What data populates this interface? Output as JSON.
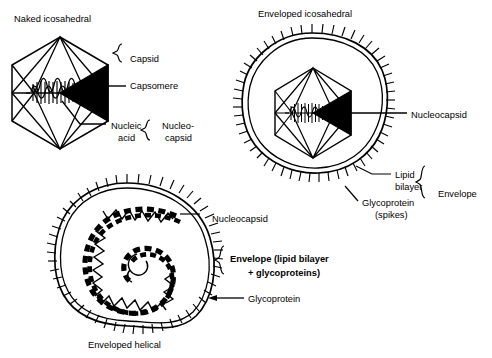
{
  "figure": {
    "background_color": "#ffffff",
    "ink_color": "#000000"
  },
  "panels": [
    {
      "id": "naked-icosahedral",
      "title": "Naked icosahedral",
      "title_pos": {
        "x": 14,
        "y": 22
      },
      "labels": [
        {
          "id": "capsid",
          "text": "Capsid",
          "x": 130,
          "y": 62
        },
        {
          "id": "capsomere",
          "text": "Capsomere",
          "x": 130,
          "y": 89
        },
        {
          "id": "nucleic-acid-1",
          "text": "Nucleic",
          "x": 111,
          "y": 129
        },
        {
          "id": "nucleic-acid-2",
          "text": "acid",
          "x": 118,
          "y": 141
        },
        {
          "id": "nucleocapsid-1",
          "text": "Nucleo-",
          "x": 162,
          "y": 129
        },
        {
          "id": "nucleocapsid-2",
          "text": "capsid",
          "x": 165,
          "y": 141
        }
      ],
      "braces": [
        "capsid-brace",
        "nucleocapsid-brace"
      ]
    },
    {
      "id": "enveloped-icosahedral",
      "title": "Enveloped icosahedral",
      "title_pos": {
        "x": 258,
        "y": 17
      },
      "labels": [
        {
          "id": "nucleocapsid",
          "text": "Nucleocapsid",
          "x": 411,
          "y": 118
        },
        {
          "id": "lipid-bilayer-1",
          "text": "Lipid",
          "x": 395,
          "y": 178
        },
        {
          "id": "lipid-bilayer-2",
          "text": "bilayer",
          "x": 395,
          "y": 190
        },
        {
          "id": "glycoprotein-1",
          "text": "Glycoprotein",
          "x": 362,
          "y": 206
        },
        {
          "id": "glycoprotein-2",
          "text": "(spikes)",
          "x": 375,
          "y": 218
        },
        {
          "id": "envelope",
          "text": "Envelope",
          "x": 438,
          "y": 197
        }
      ],
      "braces": [
        "envelope-brace"
      ]
    },
    {
      "id": "enveloped-helical",
      "title": "Enveloped helical",
      "title_pos": {
        "x": 88,
        "y": 348
      },
      "labels": [
        {
          "id": "nucleocapsid",
          "text": "Nucleocapsid",
          "x": 212,
          "y": 222
        },
        {
          "id": "envelope-bold",
          "text": "Envelope (lipid bilayer",
          "x": 230,
          "y": 262
        },
        {
          "id": "envelope-sub",
          "text": "+ glycoproteins)",
          "x": 248,
          "y": 276
        },
        {
          "id": "glycoprotein",
          "text": "Glycoprotein",
          "x": 248,
          "y": 302
        }
      ],
      "braces": [
        "envelope-helical-brace"
      ],
      "arrows": [
        "glycoprotein-arrow"
      ]
    }
  ],
  "structures": {
    "icosahedron_large": {
      "cx": 60,
      "cy": 93,
      "rx": 48,
      "ry": 56
    },
    "icosahedron_small": {
      "cx": 313,
      "cy": 113,
      "rx": 38,
      "ry": 45
    },
    "helical_nucleocapsid": {
      "cx": 127,
      "cy": 256,
      "turns": 2
    },
    "envelope_icosahedral": {
      "cx": 313,
      "cy": 113
    },
    "envelope_helical": {
      "cx": 127,
      "cy": 258
    }
  }
}
